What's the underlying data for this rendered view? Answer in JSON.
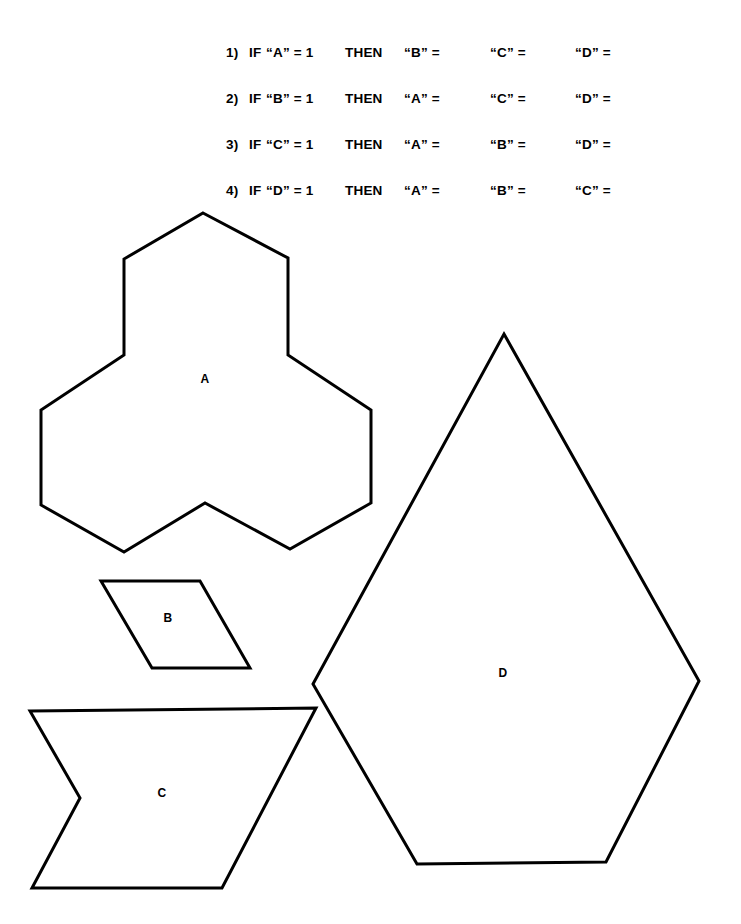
{
  "page": {
    "width": 741,
    "height": 924,
    "background_color": "#ffffff",
    "ink_color": "#000000"
  },
  "logic_block": {
    "rows": [
      {
        "index": "1)",
        "if": "IF",
        "antecedent": "“A” = 1",
        "then": "THEN",
        "consequent_1": "“B” =",
        "consequent_2": "“C” =",
        "consequent_3": "“D” =",
        "top": 45
      },
      {
        "index": "2)",
        "if": "IF",
        "antecedent": "“B” = 1",
        "then": "THEN",
        "consequent_1": "“A” =",
        "consequent_2": "“C” =",
        "consequent_3": "“D” =",
        "top": 91
      },
      {
        "index": "3)",
        "if": "IF",
        "antecedent": "“C” = 1",
        "then": "THEN",
        "consequent_1": "“A” =",
        "consequent_2": "“B” =",
        "consequent_3": "“D” =",
        "top": 137
      },
      {
        "index": "4)",
        "if": "IF",
        "antecedent": "“D” = 1",
        "then": "THEN",
        "consequent_1": "“A” =",
        "consequent_2": "“B” =",
        "consequent_3": "“C” =",
        "top": 183
      }
    ]
  },
  "figures": {
    "stroke_color": "#000000",
    "fill_color": "#ffffff",
    "stroke_width": 3,
    "shapes": [
      {
        "id": "A",
        "label": "A",
        "description": "twelve-sided tri-hexagon outline",
        "label_x": 205,
        "label_y": 379,
        "points": "203,213 288,258 288,355 371,410 371,503 290,549 205,503 124,552 41,505 41,410 124,355 124,259"
      },
      {
        "id": "B",
        "label": "B",
        "description": "parallelogram outline",
        "label_x": 168,
        "label_y": 618,
        "points": "101,581 200,581 250,668 152,668"
      },
      {
        "id": "C",
        "label": "C",
        "description": "notched chevron trapezoid outline",
        "label_x": 162,
        "label_y": 793,
        "points": "30,711 316,708 222,888 32,888 80,798"
      },
      {
        "id": "D",
        "label": "D",
        "description": "kite pentagon outline",
        "label_x": 503,
        "label_y": 673,
        "points": "504,334 699,681 606,862 417,864 313,684"
      }
    ]
  }
}
